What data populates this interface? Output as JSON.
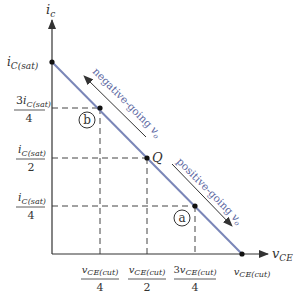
{
  "diagram": {
    "type": "transistor dc load line",
    "y_axis": {
      "label_main": "i",
      "label_sub": "c"
    },
    "x_axis": {
      "label_main": "v",
      "label_sub": "CE"
    },
    "y_ticks": [
      {
        "prefix": "",
        "main": "i",
        "sub": "C(sat)",
        "denominator": ""
      },
      {
        "prefix": "3",
        "main": "i",
        "sub": "C(sat)",
        "denominator": "4"
      },
      {
        "prefix": "",
        "main": "i",
        "sub": "C(sat)",
        "denominator": "2"
      },
      {
        "prefix": "",
        "main": "i",
        "sub": "C(sat)",
        "denominator": "4"
      }
    ],
    "x_ticks": [
      {
        "prefix": "",
        "main": "v",
        "sub": "CE(cut)",
        "denominator": "4"
      },
      {
        "prefix": "",
        "main": "v",
        "sub": "CE(cut)",
        "denominator": "2"
      },
      {
        "prefix": "3",
        "main": "v",
        "sub": "CE(cut)",
        "denominator": "4"
      },
      {
        "prefix": "",
        "main": "v",
        "sub": "CE(cut)",
        "denominator": ""
      }
    ],
    "points": {
      "b": "b",
      "q": "Q",
      "a": "a"
    },
    "arrows": {
      "negative": {
        "text": "negative-going ",
        "var": "v",
        "sub": "o"
      },
      "positive": {
        "text": "positive-going ",
        "var": "v",
        "sub": "o"
      }
    },
    "colors": {
      "load_line": "#7a86b8",
      "axis": "#333333",
      "label_arrow_text": "#5a66a0"
    }
  }
}
